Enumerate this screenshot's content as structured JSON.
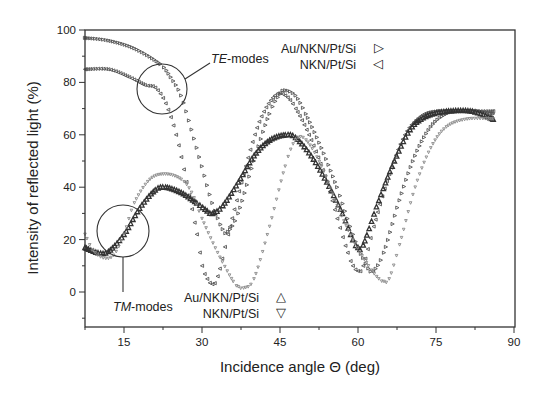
{
  "chart_data": {
    "type": "scatter",
    "title": "",
    "xlabel": "Incidence angle Θ (deg)",
    "ylabel": "Intensity of reflected light (%)",
    "xlim": [
      7.5,
      90
    ],
    "ylim": [
      -13.5,
      100
    ],
    "xticks": [
      15,
      30,
      45,
      60,
      75,
      90
    ],
    "yticks": [
      0,
      20,
      40,
      60,
      80,
      100
    ],
    "grid": false,
    "annotations": [
      {
        "text_italic": "TE",
        "text": "-modes",
        "target": "TE curves near 20-25 deg"
      },
      {
        "text_italic": "TM",
        "text": "-modes",
        "target": "TM curves near 13-17 deg"
      }
    ],
    "legends": [
      {
        "group": "TE-modes",
        "position": "top-right",
        "entries": [
          {
            "label": "Au/NKN/Pt/Si",
            "marker": "▷"
          },
          {
            "label": "NKN/Pt/Si",
            "marker": "◁"
          }
        ]
      },
      {
        "group": "TM-modes",
        "position": "bottom-center",
        "entries": [
          {
            "label": "Au/NKN/Pt/Si",
            "marker": "△"
          },
          {
            "label": "NKN/Pt/Si",
            "marker": "▽"
          }
        ]
      }
    ],
    "series": [
      {
        "name": "TE Au/NKN/Pt/Si",
        "color": "#555555",
        "size": 1.6,
        "x": [
          7.5,
          12,
          17,
          22,
          24,
          26,
          28,
          30,
          32,
          34,
          35,
          37,
          40,
          43,
          45,
          46,
          48,
          50,
          53,
          56,
          58,
          60,
          61,
          62,
          63,
          65,
          68,
          71,
          74,
          77,
          80,
          83,
          86
        ],
        "y": [
          97,
          96,
          93,
          87,
          82,
          75,
          62,
          48,
          34,
          24,
          23,
          30,
          50,
          68,
          75.5,
          77,
          75,
          68,
          55,
          40,
          28,
          17,
          13,
          9,
          8,
          15,
          35,
          52,
          63,
          68,
          69,
          69,
          68
        ]
      },
      {
        "name": "TE NKN/Pt/Si",
        "color": "#555555",
        "size": 1.6,
        "x": [
          7.5,
          12,
          16,
          19,
          21,
          23,
          25,
          27,
          29,
          30,
          31,
          32,
          33,
          35,
          38,
          41,
          44,
          46,
          48,
          51,
          54,
          56,
          58,
          59,
          60,
          61,
          63,
          66,
          69,
          72,
          75,
          80,
          86
        ],
        "y": [
          85,
          85,
          82,
          79,
          78,
          72,
          60,
          42,
          22,
          10,
          5,
          3,
          6,
          22,
          45,
          65,
          75,
          75,
          70,
          58,
          42,
          28,
          15,
          10,
          8,
          10,
          25,
          45,
          60,
          67,
          69,
          69,
          69
        ]
      },
      {
        "name": "TM Au/NKN/Pt/Si",
        "color": "#333333",
        "size": 2.2,
        "x": [
          7.5,
          10,
          12,
          15,
          18,
          21,
          23,
          26,
          29,
          31,
          32,
          34,
          37,
          40,
          43,
          46,
          48,
          51,
          54,
          57,
          59,
          60,
          61,
          64,
          67,
          70,
          73,
          77,
          82,
          86
        ],
        "y": [
          17,
          15,
          15.5,
          22,
          32,
          39,
          40,
          38,
          34,
          31,
          30,
          33,
          42,
          52,
          58,
          60,
          59,
          52,
          42,
          30,
          20,
          17,
          18,
          35,
          50,
          62,
          67,
          69,
          69,
          66
        ]
      },
      {
        "name": "TM NKN/Pt/Si",
        "color": "#8a8a8a",
        "size": 1.3,
        "x": [
          7.5,
          9,
          11,
          13,
          15,
          17,
          20,
          23,
          26,
          28,
          30,
          33,
          36,
          37,
          38,
          40,
          43,
          46,
          48,
          50,
          53,
          56,
          59,
          62,
          64,
          65,
          66,
          68,
          71,
          74,
          77,
          81,
          86
        ],
        "y": [
          22,
          16,
          13,
          14,
          22,
          34,
          43,
          45,
          43,
          38,
          28,
          15,
          4,
          2,
          1.5,
          5,
          25,
          48,
          58,
          58,
          48,
          33,
          20,
          10,
          5,
          4,
          5,
          18,
          40,
          55,
          63,
          66,
          66
        ]
      }
    ]
  }
}
